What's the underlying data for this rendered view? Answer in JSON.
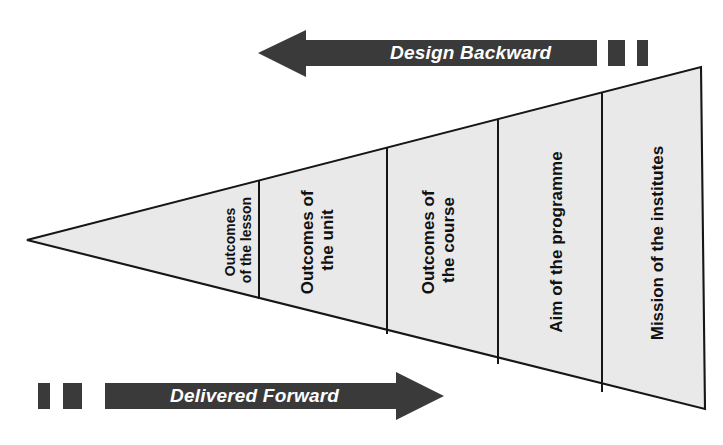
{
  "diagram": {
    "type": "nested-triangle-hierarchy",
    "background_color": "#ffffff",
    "shape_fill_color": "#e9e9e9",
    "shape_stroke_color": "#161616",
    "arrow_color": "#3a3a3a",
    "arrow_label_color": "#ffffff",
    "segment_label_color": "#111111"
  },
  "arrows": {
    "top": {
      "label": "Design Backward",
      "direction": "left",
      "icon": "arrow-left-icon",
      "dash_count": 2
    },
    "bottom": {
      "label": "Delivered Forward",
      "direction": "right",
      "icon": "arrow-right-icon",
      "dash_count": 2
    }
  },
  "triangle": {
    "apex_label": "",
    "segments": [
      {
        "id": "lesson",
        "lines": [
          "Outcomes",
          "of the lesson"
        ],
        "full_text": "Outcomes of the lesson",
        "size": "small"
      },
      {
        "id": "unit",
        "lines": [
          "Outcomes of",
          "the unit"
        ],
        "full_text": "Outcomes of the unit",
        "size": "normal"
      },
      {
        "id": "course",
        "lines": [
          "Outcomes of",
          "the course"
        ],
        "full_text": "Outcomes of the course",
        "size": "normal"
      },
      {
        "id": "programme",
        "lines": [
          "Aim of the programme"
        ],
        "full_text": "Aim of the programme",
        "size": "normal"
      },
      {
        "id": "institutes",
        "lines": [
          "Mission of the institutes"
        ],
        "full_text": "Mission of the institutes",
        "size": "normal"
      }
    ]
  }
}
